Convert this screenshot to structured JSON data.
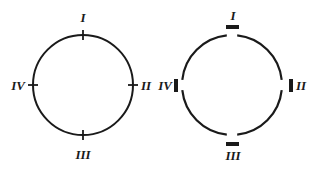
{
  "diagram": {
    "stroke_color": "#1a1a1a",
    "background": "#ffffff",
    "left_circle": {
      "description": "closed circle with thin tick marks at four positions",
      "labels": {
        "top": "I",
        "right": "II",
        "bottom": "III",
        "left": "IV"
      }
    },
    "right_circle": {
      "description": "circle broken into four arcs with thick bars at the gaps",
      "labels": {
        "top": "I",
        "right": "II",
        "bottom": "III",
        "left": "IV"
      }
    }
  }
}
